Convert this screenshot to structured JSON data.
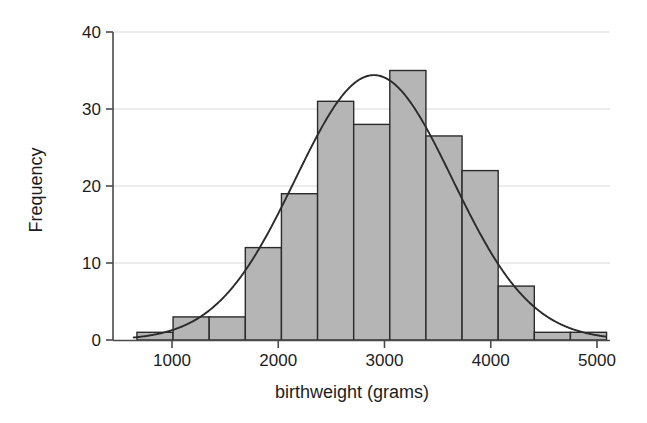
{
  "chart_data": {
    "type": "bar",
    "title": "",
    "subtitle": "",
    "xlabel": "birthweight (grams)",
    "ylabel": "Frequency",
    "xlim": [
      600,
      5060
    ],
    "ylim": [
      0,
      41
    ],
    "grid": "horizontal",
    "legend": "none",
    "bar_fill": "#b5b5b5",
    "bar_stroke": "#2b2b2b",
    "curve_color": "#2b2b2b",
    "axis_color": "#4a4a4a",
    "grid_color": "#d9d9d9",
    "bin_width": 340,
    "bin_start": 670,
    "bin_edges": [
      670,
      1010,
      1350,
      1690,
      2030,
      2370,
      2710,
      3050,
      3390,
      3730,
      4070,
      4410,
      4750,
      5090
    ],
    "bin_centers": [
      840,
      1180,
      1520,
      1860,
      2200,
      2540,
      2880,
      3220,
      3560,
      3900,
      4240,
      4580,
      4920
    ],
    "values": [
      1,
      3,
      3,
      12,
      19,
      31,
      28,
      35,
      26.5,
      22,
      7,
      1,
      1
    ],
    "x_ticks": [
      1000,
      2000,
      3000,
      4000,
      5000
    ],
    "x_tick_labels": [
      "1000",
      "2000",
      "3000",
      "4000",
      "5000"
    ],
    "y_ticks": [
      0,
      10,
      20,
      30,
      40
    ],
    "y_tick_labels": [
      "0",
      "10",
      "20",
      "30",
      "40"
    ],
    "overlay_curve": {
      "name": "normal density curve",
      "type": "line",
      "mean": 2900,
      "sd": 740,
      "peak_value": 34.4
    }
  }
}
